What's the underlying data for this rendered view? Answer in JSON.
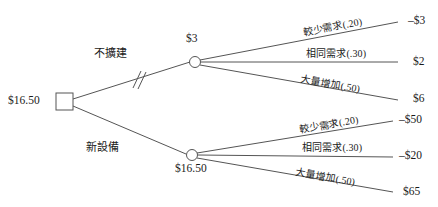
{
  "diagram": {
    "type": "decision-tree",
    "root": {
      "node_shape": "square",
      "node_role": "decision-node",
      "value_label": "$16.50"
    },
    "branches": [
      {
        "id": "no-expand",
        "label": "不擴建",
        "pruned": true,
        "prune_mark": "//",
        "chance_node": {
          "node_shape": "circle",
          "node_role": "chance-node",
          "value_label": "$3",
          "value_position": "above"
        },
        "outcomes": [
          {
            "label": "較少需求",
            "probability": "(.20)",
            "payoff": "–$3"
          },
          {
            "label": "相同需求",
            "probability": "(.30)",
            "payoff": "$2"
          },
          {
            "label": "大量增加",
            "probability": "(.50)",
            "payoff": "$6"
          }
        ]
      },
      {
        "id": "new-equipment",
        "label": "新設備",
        "pruned": false,
        "prune_mark": "",
        "chance_node": {
          "node_shape": "circle",
          "node_role": "chance-node",
          "value_label": "$16.50",
          "value_position": "below"
        },
        "outcomes": [
          {
            "label": "較少需求",
            "probability": "(.20)",
            "payoff": "–$50"
          },
          {
            "label": "相同需求",
            "probability": "(.30)",
            "payoff": "–$20"
          },
          {
            "label": "大量增加",
            "probability": "(.50)",
            "payoff": "$65"
          }
        ]
      }
    ],
    "colors": {
      "line": "#555555",
      "text": "#1a1a1a",
      "background": "#ffffff"
    }
  }
}
